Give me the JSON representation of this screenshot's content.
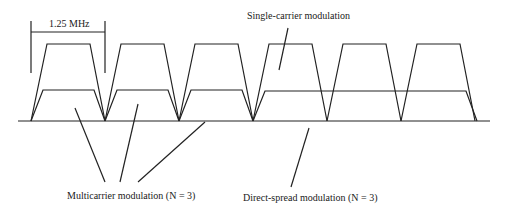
{
  "diagram": {
    "bandwidth_label": "1.25 MHz",
    "labels": {
      "single_carrier": "Single-carrier modulation",
      "multicarrier": "Multicarrier modulation (N = 3)",
      "direct_spread": "Direct-spread modulation (N = 3)"
    },
    "single_carrier_channels": 6,
    "multicarrier_subcarriers": 3,
    "direct_spread_channels_spanned": 3,
    "line_color": "#222222"
  }
}
